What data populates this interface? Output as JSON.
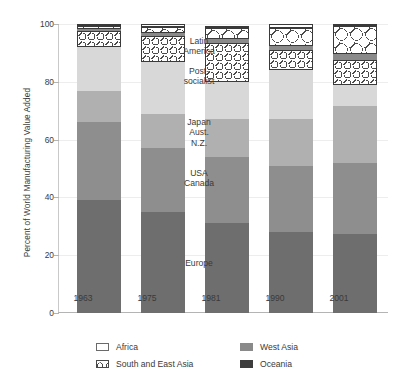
{
  "chart_data": {
    "type": "bar",
    "title": "",
    "subtitle": "",
    "xlabel": "",
    "ylabel": "Percent of World Manufacturing Value Added",
    "ylim": [
      0,
      100
    ],
    "yticks": [
      0,
      20,
      40,
      60,
      80,
      100
    ],
    "ytick_labels": [
      "0",
      "20",
      "40",
      "60",
      "80",
      "100"
    ],
    "grid": true,
    "stacked": true,
    "legend_position": "bottom",
    "categories": [
      "1963",
      "1975",
      "1981",
      "1990",
      "2001"
    ],
    "series": [
      {
        "name": "Europe",
        "values": [
          39.0,
          35.0,
          31.0,
          28.0,
          27.5
        ]
      },
      {
        "name": "USA Canada",
        "values": [
          27.0,
          22.0,
          23.0,
          23.0,
          24.5
        ]
      },
      {
        "name": "Japan Aust. N.Z.",
        "values": [
          11.0,
          12.0,
          13.0,
          16.0,
          19.5
        ]
      },
      {
        "name": "Post-socialist",
        "values": [
          15.0,
          18.0,
          13.0,
          17.0,
          7.5
        ]
      },
      {
        "name": "Latin America",
        "values": [
          5.5,
          9.0,
          13.5,
          7.0,
          8.5
        ]
      },
      {
        "name": "West Asia",
        "values": [
          0.7,
          1.0,
          1.5,
          1.5,
          2.0
        ]
      },
      {
        "name": "South and East Asia",
        "values": [
          1.3,
          2.0,
          3.5,
          6.0,
          10.0
        ]
      },
      {
        "name": "Africa",
        "values": [
          0.5,
          1.0,
          1.0,
          1.5,
          0.5
        ]
      }
    ],
    "annotations": [
      {
        "text": "Latin\nAmerica",
        "series": "Latin America"
      },
      {
        "text": "Post-\nsocialist",
        "series": "Post-socialist"
      },
      {
        "text": "Japan\nAust.\nN.Z.",
        "series": "Japan Aust. N.Z."
      },
      {
        "text": "USA\nCanada",
        "series": "USA Canada"
      },
      {
        "text": "Europe",
        "series": "Europe"
      }
    ]
  },
  "axis": {
    "y_title": "Percent of World Manufacturing Value Added",
    "ticks": {
      "t100": "100",
      "t80": "80",
      "t60": "60",
      "t40": "40",
      "t20": "20",
      "t0": "0"
    },
    "x": {
      "c0": "1963",
      "c1": "1975",
      "c2": "1981",
      "c3": "1990",
      "c4": "2001"
    }
  },
  "annotations": {
    "latin_america": "Latin\nAmerica",
    "post_socialist": "Post-\nsocialist",
    "japan": "Japan\nAust.\nN.Z.",
    "usa_canada": "USA\nCanada",
    "europe": "Europe"
  },
  "legend": {
    "items": [
      {
        "label": "Africa",
        "swatch": "africa-swatch",
        "color": "#ffffff"
      },
      {
        "label": "West Asia",
        "swatch": "west-asia-swatch",
        "color": "#8a8a8a"
      },
      {
        "label": "South and East Asia",
        "swatch": "south-east-asia-swatch",
        "color": "#ffffff"
      },
      {
        "label": "Oceania",
        "swatch": "oceania-swatch",
        "color": "#3d3d3d"
      }
    ]
  },
  "colors": {
    "europe": "#6e6e6e",
    "usa_canada": "#8e8e8e",
    "japan_aust_nz": "#b0b0b0",
    "post_socialist": "#d8d8d8",
    "latin_america": "#ffffff",
    "west_asia": "#8a8a8a",
    "south_east_asia": "#ffffff",
    "africa": "#ffffff",
    "oceania": "#3d3d3d",
    "axis": "#b4b4b4",
    "grid": "#ededed",
    "text": "#3a3a3a"
  }
}
